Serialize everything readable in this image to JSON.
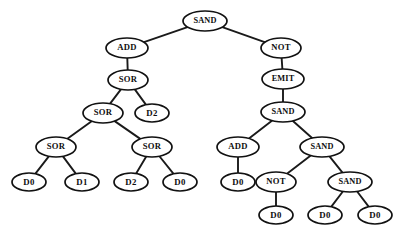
{
  "figure": {
    "kind": "expression-tree",
    "background_color": "#ffffff",
    "node_fill_color": "#ffffff",
    "node_stroke_color": "#111111",
    "edge_color": "#1a1a1a",
    "text_color": "#0d0d0d"
  },
  "nodes": [
    {
      "id": "n0",
      "label": "SAND",
      "x": 205,
      "y": 21,
      "rx": 22,
      "ry": 10,
      "depth": 0
    },
    {
      "id": "n1",
      "label": "ADD",
      "x": 127,
      "y": 48,
      "rx": 21,
      "ry": 10,
      "depth": 1
    },
    {
      "id": "n2",
      "label": "NOT",
      "x": 281,
      "y": 48,
      "rx": 20,
      "ry": 10,
      "depth": 1
    },
    {
      "id": "n3",
      "label": "SOR",
      "x": 128,
      "y": 80,
      "rx": 20,
      "ry": 10,
      "depth": 2
    },
    {
      "id": "n4",
      "label": "EMIT",
      "x": 283,
      "y": 79,
      "rx": 21,
      "ry": 10,
      "depth": 2
    },
    {
      "id": "n5",
      "label": "SOR",
      "x": 103,
      "y": 113,
      "rx": 20,
      "ry": 10,
      "depth": 3
    },
    {
      "id": "n6",
      "label": "D2",
      "x": 152,
      "y": 113,
      "rx": 17,
      "ry": 9,
      "depth": 3
    },
    {
      "id": "n7",
      "label": "SAND",
      "x": 283,
      "y": 112,
      "rx": 22,
      "ry": 10,
      "depth": 3
    },
    {
      "id": "n8",
      "label": "SOR",
      "x": 56,
      "y": 147,
      "rx": 20,
      "ry": 10,
      "depth": 4
    },
    {
      "id": "n9",
      "label": "SOR",
      "x": 152,
      "y": 147,
      "rx": 20,
      "ry": 10,
      "depth": 4
    },
    {
      "id": "n10",
      "label": "ADD",
      "x": 238,
      "y": 147,
      "rx": 21,
      "ry": 10,
      "depth": 4
    },
    {
      "id": "n11",
      "label": "SAND",
      "x": 322,
      "y": 147,
      "rx": 22,
      "ry": 10,
      "depth": 4
    },
    {
      "id": "n12",
      "label": "D0",
      "x": 29,
      "y": 182,
      "rx": 17,
      "ry": 9,
      "depth": 5
    },
    {
      "id": "n13",
      "label": "D1",
      "x": 82,
      "y": 182,
      "rx": 17,
      "ry": 9,
      "depth": 5
    },
    {
      "id": "n14",
      "label": "D2",
      "x": 131,
      "y": 182,
      "rx": 17,
      "ry": 9,
      "depth": 5
    },
    {
      "id": "n15",
      "label": "D0",
      "x": 180,
      "y": 182,
      "rx": 17,
      "ry": 9,
      "depth": 5
    },
    {
      "id": "n16",
      "label": "D0",
      "x": 238,
      "y": 182,
      "rx": 17,
      "ry": 9,
      "depth": 5
    },
    {
      "id": "n17",
      "label": "NOT",
      "x": 276,
      "y": 182,
      "rx": 20,
      "ry": 10,
      "depth": 5
    },
    {
      "id": "n18",
      "label": "SAND",
      "x": 350,
      "y": 182,
      "rx": 22,
      "ry": 10,
      "depth": 5
    },
    {
      "id": "n19",
      "label": "D0",
      "x": 276,
      "y": 215,
      "rx": 17,
      "ry": 9,
      "depth": 6
    },
    {
      "id": "n20",
      "label": "D0",
      "x": 325,
      "y": 215,
      "rx": 17,
      "ry": 9,
      "depth": 6
    },
    {
      "id": "n21",
      "label": "D0",
      "x": 375,
      "y": 215,
      "rx": 17,
      "ry": 9,
      "depth": 6
    }
  ],
  "edges": [
    {
      "from": "n0",
      "to": "n1"
    },
    {
      "from": "n0",
      "to": "n2"
    },
    {
      "from": "n1",
      "to": "n3"
    },
    {
      "from": "n2",
      "to": "n4"
    },
    {
      "from": "n3",
      "to": "n5"
    },
    {
      "from": "n3",
      "to": "n6"
    },
    {
      "from": "n4",
      "to": "n7"
    },
    {
      "from": "n5",
      "to": "n8"
    },
    {
      "from": "n5",
      "to": "n9"
    },
    {
      "from": "n7",
      "to": "n10"
    },
    {
      "from": "n7",
      "to": "n11"
    },
    {
      "from": "n8",
      "to": "n12"
    },
    {
      "from": "n8",
      "to": "n13"
    },
    {
      "from": "n9",
      "to": "n14"
    },
    {
      "from": "n9",
      "to": "n15"
    },
    {
      "from": "n10",
      "to": "n16"
    },
    {
      "from": "n11",
      "to": "n17"
    },
    {
      "from": "n11",
      "to": "n18"
    },
    {
      "from": "n17",
      "to": "n19"
    },
    {
      "from": "n18",
      "to": "n20"
    },
    {
      "from": "n18",
      "to": "n21"
    }
  ]
}
